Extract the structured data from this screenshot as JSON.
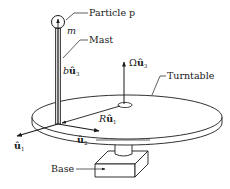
{
  "figure": {
    "type": "physics-diagram"
  },
  "labels": {
    "particle": "Particle p",
    "mass": "m",
    "mast": "Mast",
    "mast_vector_coef": "b",
    "mast_vector": "û",
    "mast_vector_sub": "3",
    "omega_coef": "Ω",
    "omega_vector": "û",
    "omega_vector_sub": "3",
    "turntable": "Turntable",
    "radius_coef": "R",
    "radius_vector": "û",
    "radius_vector_sub": "1",
    "axis1": "û",
    "axis1_sub": "1",
    "axis2": "û",
    "axis2_sub": "2",
    "base": "Base"
  },
  "colors": {
    "stroke": "#1a1a1a",
    "background": "#ffffff"
  }
}
